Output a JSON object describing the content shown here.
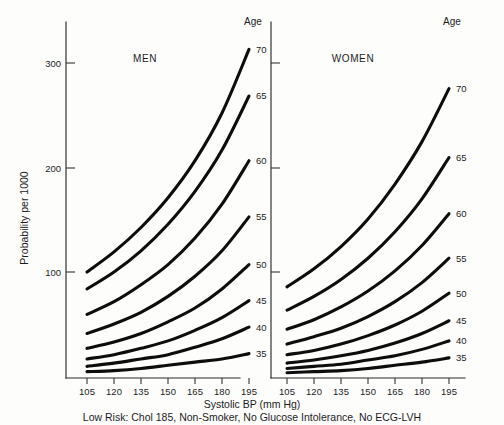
{
  "figure": {
    "background_color": "#fdfdfc",
    "ink_color": "#0d0d0d",
    "y_axis_title": "Probability per 1000",
    "x_axis_title": "Systolic BP (mm Hg)",
    "caption": "Low Risk: Chol 185, Non-Smoker, No Glucose Intolerance, No ECG-LVH",
    "age_header_left": "Age",
    "age_header_right": "Age",
    "panel_men_title": "MEN",
    "panel_women_title": "WOMEN"
  },
  "chart_data": {
    "type": "line",
    "xlabel": "Systolic BP (mm Hg)",
    "ylabel": "Probability per 1000",
    "annotations": [
      "Low Risk: Chol 185, Non-Smoker, No Glucose Intolerance, No ECG-LVH"
    ],
    "grid": false,
    "legend_position": "right-of-each-panel (age labels at curve ends)",
    "x": [
      105,
      120,
      135,
      150,
      165,
      180,
      195
    ],
    "xlim": [
      100,
      200
    ],
    "ylim": [
      0,
      330
    ],
    "yticks": [
      100,
      200,
      300
    ],
    "xticks": [
      105,
      120,
      135,
      150,
      165,
      180,
      195
    ],
    "panels": [
      {
        "name": "MEN",
        "series": [
          {
            "name": "70",
            "age": 70,
            "values": [
              100,
              119,
              142,
              170,
              205,
              250,
              310
            ]
          },
          {
            "name": "65",
            "age": 65,
            "values": [
              84,
              100,
              120,
              145,
              176,
              215,
              266
            ]
          },
          {
            "name": "60",
            "age": 60,
            "values": [
              60,
              72,
              88,
              107,
              132,
              164,
              205
            ]
          },
          {
            "name": "55",
            "age": 55,
            "values": [
              42,
              51,
              62,
              77,
              96,
              120,
              152
            ]
          },
          {
            "name": "50",
            "age": 50,
            "values": [
              28,
              34,
              42,
              53,
              66,
              84,
              107
            ]
          },
          {
            "name": "45",
            "age": 45,
            "values": [
              18,
              22,
              28,
              35,
              45,
              57,
              73
            ]
          },
          {
            "name": "40",
            "age": 40,
            "values": [
              11,
              14,
              18,
              22,
              29,
              37,
              48
            ]
          },
          {
            "name": "35",
            "age": 35,
            "values": [
              6,
              7,
              9,
              12,
              15,
              18,
              23
            ]
          }
        ]
      },
      {
        "name": "WOMEN",
        "series": [
          {
            "name": "70",
            "age": 70,
            "values": [
              86,
              103,
              124,
              150,
              183,
              223,
              273
            ]
          },
          {
            "name": "65",
            "age": 65,
            "values": [
              64,
              77,
              93,
              113,
              138,
              169,
              208
            ]
          },
          {
            "name": "60",
            "age": 60,
            "values": [
              46,
              55,
              67,
              82,
              101,
              125,
              155
            ]
          },
          {
            "name": "55",
            "age": 55,
            "values": [
              32,
              39,
              47,
              58,
              72,
              90,
              113
            ]
          },
          {
            "name": "50",
            "age": 50,
            "values": [
              22,
              26,
              32,
              40,
              50,
              63,
              80
            ]
          },
          {
            "name": "45",
            "age": 45,
            "values": [
              14,
              17,
              21,
              26,
              33,
              42,
              54
            ]
          },
          {
            "name": "40",
            "age": 40,
            "values": [
              9,
              11,
              13,
              17,
              21,
              27,
              35
            ]
          },
          {
            "name": "35",
            "age": 35,
            "values": [
              5,
              6,
              7,
              9,
              12,
              15,
              19
            ]
          }
        ]
      }
    ]
  }
}
